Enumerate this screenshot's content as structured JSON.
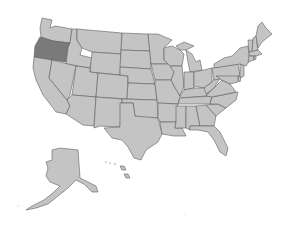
{
  "map": {
    "title": "United States",
    "default_fill": "#c4c4c4",
    "highlight_fill": "#7a7a7a",
    "border_color": "#5e5e5e",
    "background": "#ffffff",
    "highlighted_states": [
      "Oregon"
    ],
    "states": [
      {
        "id": "WA",
        "name": "Washington"
      },
      {
        "id": "OR",
        "name": "Oregon",
        "highlighted": true
      },
      {
        "id": "CA",
        "name": "California"
      },
      {
        "id": "ID",
        "name": "Idaho"
      },
      {
        "id": "NV",
        "name": "Nevada"
      },
      {
        "id": "MT",
        "name": "Montana"
      },
      {
        "id": "WY",
        "name": "Wyoming"
      },
      {
        "id": "UT",
        "name": "Utah"
      },
      {
        "id": "AZ",
        "name": "Arizona"
      },
      {
        "id": "CO",
        "name": "Colorado"
      },
      {
        "id": "NM",
        "name": "New Mexico"
      },
      {
        "id": "ND",
        "name": "North Dakota"
      },
      {
        "id": "SD",
        "name": "South Dakota"
      },
      {
        "id": "NE",
        "name": "Nebraska"
      },
      {
        "id": "KS",
        "name": "Kansas"
      },
      {
        "id": "OK",
        "name": "Oklahoma"
      },
      {
        "id": "TX",
        "name": "Texas"
      },
      {
        "id": "MN",
        "name": "Minnesota"
      },
      {
        "id": "IA",
        "name": "Iowa"
      },
      {
        "id": "MO",
        "name": "Missouri"
      },
      {
        "id": "AR",
        "name": "Arkansas"
      },
      {
        "id": "LA",
        "name": "Louisiana"
      },
      {
        "id": "WI",
        "name": "Wisconsin"
      },
      {
        "id": "IL",
        "name": "Illinois"
      },
      {
        "id": "MI",
        "name": "Michigan"
      },
      {
        "id": "IN",
        "name": "Indiana"
      },
      {
        "id": "OH",
        "name": "Ohio"
      },
      {
        "id": "KY",
        "name": "Kentucky"
      },
      {
        "id": "TN",
        "name": "Tennessee"
      },
      {
        "id": "MS",
        "name": "Mississippi"
      },
      {
        "id": "AL",
        "name": "Alabama"
      },
      {
        "id": "GA",
        "name": "Georgia"
      },
      {
        "id": "FL",
        "name": "Florida"
      },
      {
        "id": "SC",
        "name": "South Carolina"
      },
      {
        "id": "NC",
        "name": "North Carolina"
      },
      {
        "id": "VA",
        "name": "Virginia"
      },
      {
        "id": "WV",
        "name": "West Virginia"
      },
      {
        "id": "PA",
        "name": "Pennsylvania"
      },
      {
        "id": "NY",
        "name": "New York"
      },
      {
        "id": "VT",
        "name": "Vermont"
      },
      {
        "id": "NH",
        "name": "New Hampshire"
      },
      {
        "id": "ME",
        "name": "Maine"
      },
      {
        "id": "MA",
        "name": "Massachusetts"
      },
      {
        "id": "CT",
        "name": "Connecticut"
      },
      {
        "id": "RI",
        "name": "Rhode Island"
      },
      {
        "id": "NJ",
        "name": "New Jersey"
      },
      {
        "id": "DE",
        "name": "Delaware"
      },
      {
        "id": "MD",
        "name": "Maryland"
      },
      {
        "id": "AK",
        "name": "Alaska"
      },
      {
        "id": "HI",
        "name": "Hawaii"
      }
    ]
  }
}
